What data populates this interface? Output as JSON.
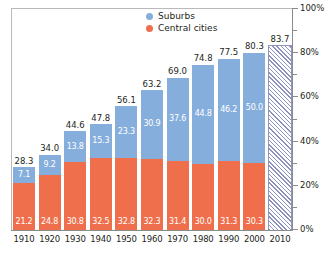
{
  "chart_data": {
    "type": "bar",
    "subtype": "stacked",
    "title": "",
    "xlabel": "",
    "ylabel": "",
    "ylim": [
      0,
      100
    ],
    "ytick_labels": [
      "0%",
      "20%",
      "40%",
      "60%",
      "80%",
      "100%"
    ],
    "ytick_values": [
      0,
      20,
      40,
      60,
      80,
      100
    ],
    "minor_tick_interval": 10,
    "grid": false,
    "legend_position": "top-center",
    "categories": [
      "1910",
      "1920",
      "1930",
      "1940",
      "1950",
      "1960",
      "1970",
      "1980",
      "1990",
      "2000",
      "2010"
    ],
    "series": [
      {
        "name": "Suburbs",
        "color": "#86aedc",
        "values": [
          7.1,
          9.2,
          13.8,
          15.3,
          23.3,
          30.9,
          37.6,
          44.8,
          46.2,
          50.0,
          null
        ]
      },
      {
        "name": "Central cities",
        "color": "#ef6f4c",
        "values": [
          21.2,
          24.8,
          30.8,
          32.5,
          32.8,
          32.3,
          31.4,
          30.0,
          31.3,
          30.3,
          null
        ]
      }
    ],
    "totals": [
      28.3,
      34.0,
      44.6,
      47.8,
      56.1,
      63.2,
      69.0,
      74.8,
      77.5,
      80.3,
      83.7
    ],
    "projected": {
      "category": "2010",
      "value": 83.7,
      "style": "diagonal-hatch",
      "color": "#8d92bd"
    },
    "bars": [
      {
        "category": "1910",
        "total": "28.3",
        "suburbs": "7.1",
        "central": "21.2",
        "projected": false
      },
      {
        "category": "1920",
        "total": "34.0",
        "suburbs": "9.2",
        "central": "24.8",
        "projected": false
      },
      {
        "category": "1930",
        "total": "44.6",
        "suburbs": "13.8",
        "central": "30.8",
        "projected": false
      },
      {
        "category": "1940",
        "total": "47.8",
        "suburbs": "15.3",
        "central": "32.5",
        "projected": false
      },
      {
        "category": "1950",
        "total": "56.1",
        "suburbs": "23.3",
        "central": "32.8",
        "projected": false
      },
      {
        "category": "1960",
        "total": "63.2",
        "suburbs": "30.9",
        "central": "32.3",
        "projected": false
      },
      {
        "category": "1970",
        "total": "69.0",
        "suburbs": "37.6",
        "central": "31.4",
        "projected": false
      },
      {
        "category": "1980",
        "total": "74.8",
        "suburbs": "44.8",
        "central": "30.0",
        "projected": false
      },
      {
        "category": "1990",
        "total": "77.5",
        "suburbs": "46.2",
        "central": "31.3",
        "projected": false
      },
      {
        "category": "2000",
        "total": "80.3",
        "suburbs": "50.0",
        "central": "30.3",
        "projected": false
      },
      {
        "category": "2010",
        "total": "83.7",
        "suburbs": "",
        "central": "",
        "projected": true
      }
    ]
  },
  "legend": {
    "items": [
      {
        "label": "Suburbs",
        "color": "#86aedc"
      },
      {
        "label": "Central cities",
        "color": "#ef6f4c"
      }
    ]
  }
}
